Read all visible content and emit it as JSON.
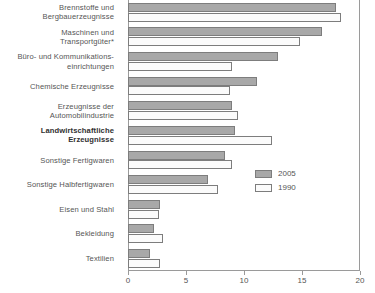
{
  "chart_data": {
    "type": "bar",
    "orientation": "horizontal",
    "title": "",
    "xlabel": "",
    "ylabel": "",
    "xlim": [
      0,
      20
    ],
    "xticks": [
      0,
      5,
      10,
      15,
      20
    ],
    "xtick_labels": [
      "0",
      "5",
      "10",
      "15",
      "20"
    ],
    "grid": false,
    "legend_position": "middle-right",
    "categories": [
      "Brennstoffe und Bergbauerzeugnisse",
      "Maschinen und Transportgüter*",
      "Büro- und Kommunikations-einrichtungen",
      "Chemische Erzeugnisse",
      "Erzeugnisse der Automobilindustrie",
      "Landwirtschaftliche Erzeugnisse",
      "Sonstige Fertigwaren",
      "Sonstige Halbfertigwaren",
      "Eisen und Stahl",
      "Bekleidung",
      "Textilien"
    ],
    "series": [
      {
        "name": "2005",
        "color": "#a8a8a8",
        "values": [
          17.9,
          16.7,
          12.9,
          11.1,
          9.0,
          9.2,
          8.4,
          6.9,
          2.8,
          2.2,
          1.9
        ]
      },
      {
        "name": "1990",
        "color": "#fbfbfb",
        "values": [
          18.4,
          14.8,
          9.0,
          8.8,
          9.5,
          12.4,
          9.0,
          7.8,
          2.7,
          3.0,
          2.8
        ]
      }
    ]
  },
  "categories_lines": [
    [
      "Brennstoffe und",
      "Bergbauerzeugnisse"
    ],
    [
      "Maschinen und",
      "Transportgüter*"
    ],
    [
      "Büro- und Kommunikations-",
      "einrichtungen"
    ],
    [
      "Chemische Erzeugnisse"
    ],
    [
      "Erzeugnisse der",
      "Automobilindustrie"
    ],
    [
      "Landwirtschaftliche",
      "Erzeugnisse"
    ],
    [
      "Sonstige Fertigwaren"
    ],
    [
      "Sonstige Halbfertigwaren"
    ],
    [
      "Eisen und Stahl"
    ],
    [
      "Bekleidung"
    ],
    [
      "Textilien"
    ]
  ],
  "legend": {
    "items": [
      {
        "label": "2005",
        "color": "#a8a8a8"
      },
      {
        "label": "1990",
        "color": "#fbfbfb"
      }
    ]
  },
  "axis": {
    "tick_labels": [
      "0",
      "5",
      "10",
      "15",
      "20"
    ]
  }
}
